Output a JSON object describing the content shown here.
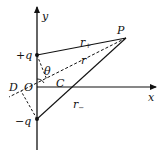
{
  "diagram": {
    "type": "electric-dipole-geometry",
    "axes": {
      "x_label": "x",
      "y_label": "y"
    },
    "points": {
      "origin": "O",
      "field_point": "P",
      "foot_c": "C",
      "foot_d": "D"
    },
    "charges": {
      "positive": "+q",
      "negative": "−q"
    },
    "distances": {
      "r": "r",
      "r_plus_base": "r",
      "r_plus_sub": "+",
      "r_minus_base": "r",
      "r_minus_sub": "−"
    },
    "angle": "θ",
    "colors": {
      "line": "#111111",
      "background": "#ffffff"
    }
  }
}
